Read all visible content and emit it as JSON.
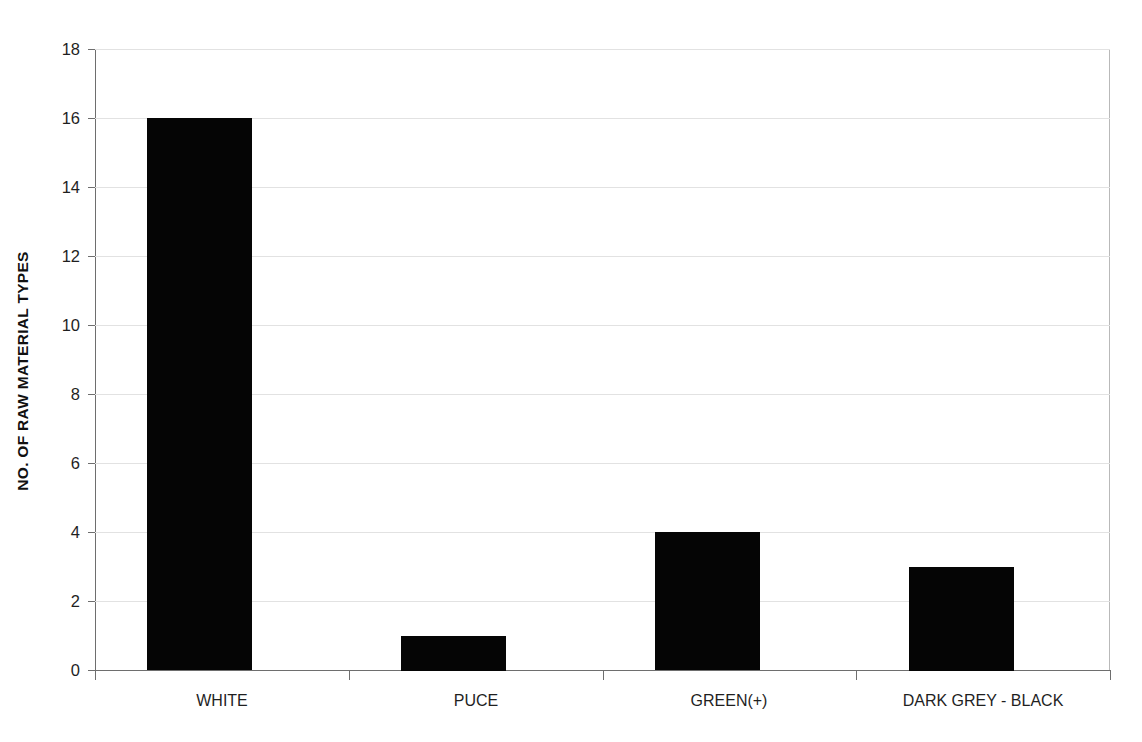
{
  "chart_data": {
    "type": "bar",
    "title": "",
    "xlabel": "",
    "ylabel": "NO. OF RAW MATERIAL TYPES",
    "categories": [
      "WHITE",
      "PUCE",
      "GREEN(+)",
      "DARK GREY - BLACK"
    ],
    "values": [
      16,
      1,
      4,
      3
    ],
    "ylim": [
      0,
      18
    ],
    "y_ticks": [
      0,
      2,
      4,
      6,
      8,
      10,
      12,
      14,
      16,
      18
    ],
    "y_tick_labels": [
      "0",
      "2",
      "4",
      "6",
      "8",
      "10",
      "12",
      "14",
      "16",
      "18"
    ],
    "grid": true,
    "legend": false,
    "legend_position": "none",
    "bar_color": "#050505",
    "gridline_color": "#e2e2e2",
    "axis_color": "#6e6e6e",
    "background_color": "#ffffff"
  }
}
